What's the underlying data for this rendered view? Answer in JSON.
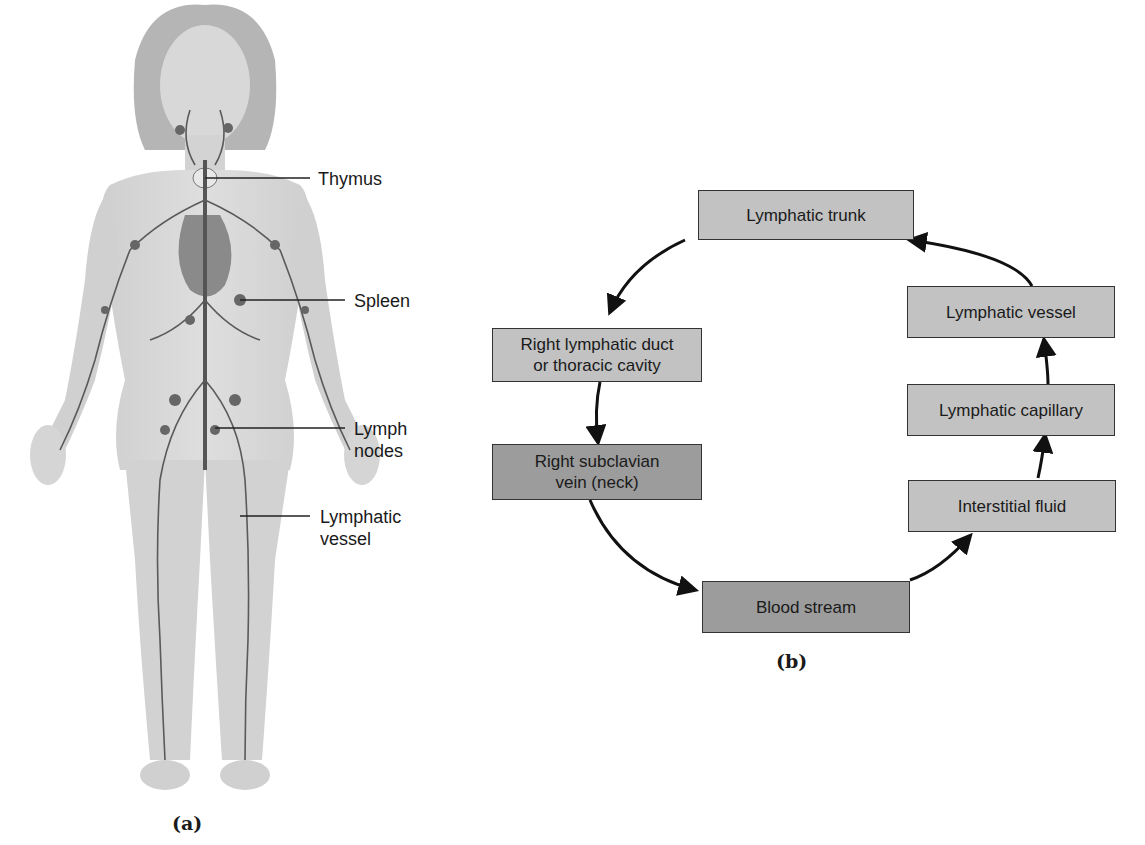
{
  "panel_a": {
    "caption": "(a)",
    "labels": [
      {
        "id": "thymus",
        "text": "Thymus"
      },
      {
        "id": "spleen",
        "text": "Spleen"
      },
      {
        "id": "lymph-nodes",
        "line1": "Lymph",
        "line2": "nodes"
      },
      {
        "id": "lymphatic-vessel",
        "line1": "Lymphatic",
        "line2": "vessel"
      }
    ]
  },
  "panel_b": {
    "caption": "(b)",
    "boxes": {
      "lymphatic_trunk": "Lymphatic trunk",
      "lymphatic_vessel": "Lymphatic vessel",
      "lymphatic_capillary": "Lymphatic capillary",
      "interstitial_fluid": "Interstitial fluid",
      "blood_stream": "Blood stream",
      "right_subclavian_line1": "Right subclavian",
      "right_subclavian_line2": "vein (neck)",
      "right_lymphatic_line1": "Right lymphatic duct",
      "right_lymphatic_line2": "or thoracic cavity"
    },
    "flow_order": [
      "Interstitial fluid",
      "Lymphatic capillary",
      "Lymphatic vessel",
      "Lymphatic trunk",
      "Right lymphatic duct or thoracic cavity",
      "Right subclavian vein (neck)",
      "Blood stream",
      "Interstitial fluid"
    ]
  }
}
